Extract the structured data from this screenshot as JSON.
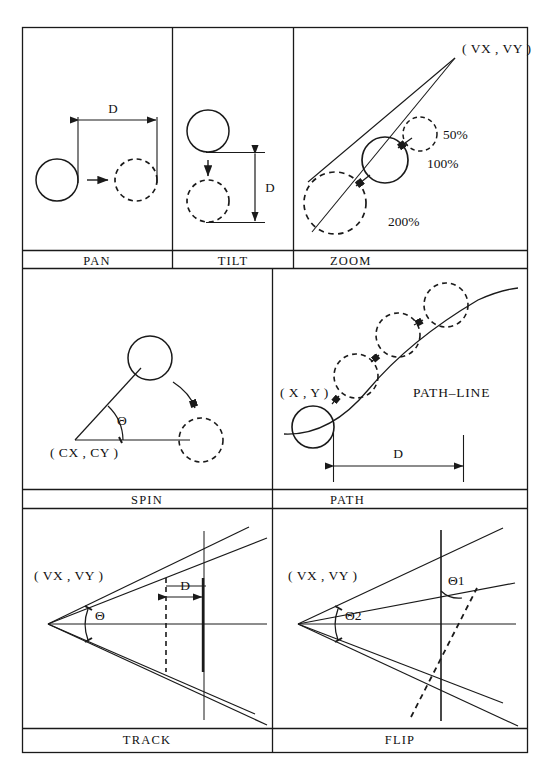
{
  "figure": {
    "stroke_color": "#1a1a1a",
    "background_color": "#ffffff",
    "rows": 3,
    "columns_row1": 3,
    "columns_row2": 2,
    "columns_row3": 2
  },
  "panels": [
    {
      "id": "pan",
      "label": "PAN",
      "annotations": [
        {
          "key": "distance",
          "text": "D"
        }
      ]
    },
    {
      "id": "tilt",
      "label": "TILT",
      "annotations": [
        {
          "key": "distance",
          "text": "D"
        }
      ]
    },
    {
      "id": "zoom",
      "label": "ZOOM",
      "annotations": [
        {
          "key": "vanishing_point",
          "text": "( VX , VY )"
        },
        {
          "key": "scale_small",
          "text": "50%"
        },
        {
          "key": "scale_mid",
          "text": "100%"
        },
        {
          "key": "scale_large",
          "text": "200%"
        }
      ]
    },
    {
      "id": "spin",
      "label": "SPIN",
      "annotations": [
        {
          "key": "center",
          "text": "( CX , CY )"
        },
        {
          "key": "angle",
          "text": "Θ"
        }
      ]
    },
    {
      "id": "path",
      "label": "PATH",
      "annotations": [
        {
          "key": "start_point",
          "text": "( X , Y )"
        },
        {
          "key": "path_line",
          "text": "PATH–LINE"
        },
        {
          "key": "distance",
          "text": "D"
        }
      ]
    },
    {
      "id": "track",
      "label": "TRACK",
      "annotations": [
        {
          "key": "vanishing_point",
          "text": "( VX , VY )"
        },
        {
          "key": "angle",
          "text": "Θ"
        },
        {
          "key": "distance",
          "text": "D"
        }
      ]
    },
    {
      "id": "flip",
      "label": "FLIP",
      "annotations": [
        {
          "key": "vanishing_point",
          "text": "( VX , VY )"
        },
        {
          "key": "angle1",
          "text": "Θ1"
        },
        {
          "key": "angle2",
          "text": "Θ2"
        }
      ]
    }
  ]
}
